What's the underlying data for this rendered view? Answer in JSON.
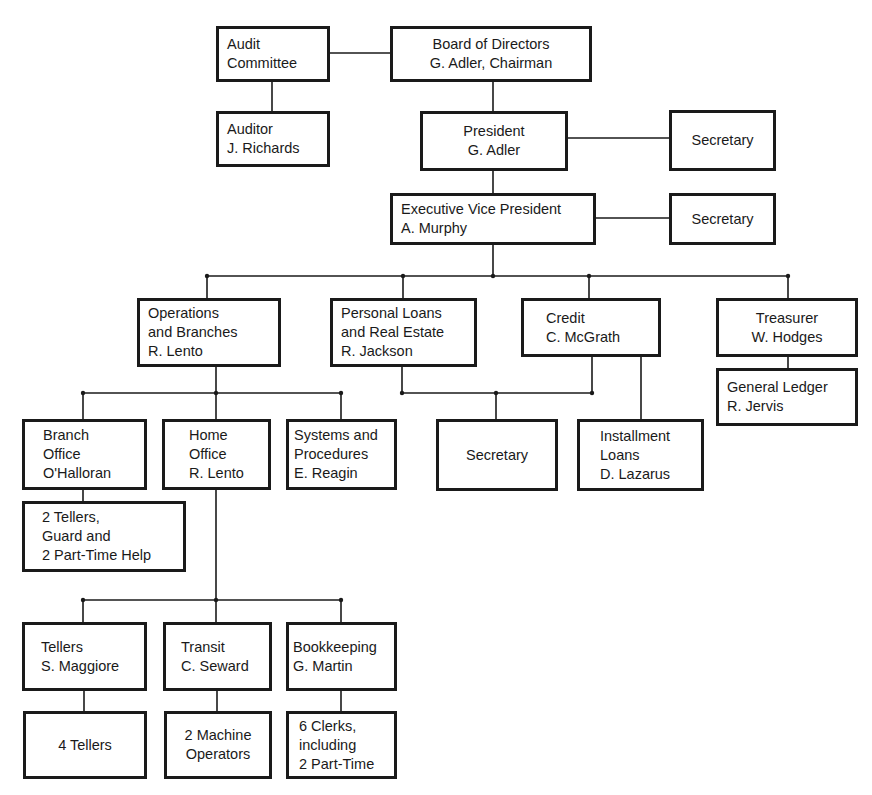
{
  "chart_title": "",
  "nodes": {
    "audit_committee": {
      "lines": [
        "Audit",
        "Committee"
      ]
    },
    "board": {
      "lines": [
        "Board of Directors",
        "G. Adler, Chairman"
      ]
    },
    "auditor": {
      "lines": [
        "Auditor",
        "J. Richards"
      ]
    },
    "president": {
      "lines": [
        "President",
        "G. Adler"
      ]
    },
    "president_secretary": {
      "lines": [
        "Secretary"
      ]
    },
    "evp": {
      "lines": [
        "Executive Vice President",
        "A. Murphy"
      ]
    },
    "evp_secretary": {
      "lines": [
        "Secretary"
      ]
    },
    "operations": {
      "lines": [
        "Operations",
        "and Branches",
        "R. Lento"
      ]
    },
    "personal_loans": {
      "lines": [
        "Personal Loans",
        "and Real Estate",
        "R. Jackson"
      ]
    },
    "credit": {
      "lines": [
        "Credit",
        "C. McGrath"
      ]
    },
    "treasurer": {
      "lines": [
        "Treasurer",
        "W. Hodges"
      ]
    },
    "general_ledger": {
      "lines": [
        "General Ledger",
        "R. Jervis"
      ]
    },
    "branch_office": {
      "lines": [
        "Branch",
        "Office",
        "O'Halloran"
      ]
    },
    "home_office": {
      "lines": [
        "Home",
        "Office",
        "R. Lento"
      ]
    },
    "systems": {
      "lines": [
        "Systems and",
        "Procedures",
        "E. Reagin"
      ]
    },
    "branch_staff": {
      "lines": [
        "2 Tellers,",
        "Guard and",
        "2 Part-Time Help"
      ]
    },
    "loans_secretary": {
      "lines": [
        "Secretary"
      ]
    },
    "installment_loans": {
      "lines": [
        "Installment",
        "Loans",
        "D. Lazarus"
      ]
    },
    "tellers": {
      "lines": [
        "Tellers",
        "S. Maggiore"
      ]
    },
    "transit": {
      "lines": [
        "Transit",
        "C. Seward"
      ]
    },
    "bookkeeping": {
      "lines": [
        "Bookkeeping",
        "G. Martin"
      ]
    },
    "tellers_staff": {
      "lines": [
        "4 Tellers"
      ]
    },
    "transit_staff": {
      "lines": [
        "2 Machine",
        "Operators"
      ]
    },
    "bookkeeping_staff": {
      "lines": [
        "6 Clerks,",
        "including",
        "2 Part-Time"
      ]
    }
  },
  "colors": {
    "line": "#1a1a1a",
    "background": "#ffffff"
  }
}
